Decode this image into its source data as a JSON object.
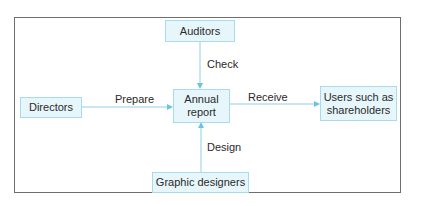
{
  "diagram": {
    "type": "flow",
    "nodes": {
      "auditors": "Auditors",
      "annual_report_line1": "Annual",
      "annual_report_line2": "report",
      "directors": "Directors",
      "users_line1": "Users such as",
      "users_line2": "shareholders",
      "graphic_designers": "Graphic designers"
    },
    "edges": {
      "check": "Check",
      "prepare": "Prepare",
      "receive": "Receive",
      "design": "Design"
    },
    "relations": [
      {
        "from": "Auditors",
        "to": "Annual report",
        "label": "Check"
      },
      {
        "from": "Directors",
        "to": "Annual report",
        "label": "Prepare"
      },
      {
        "from": "Annual report",
        "to": "Users such as shareholders",
        "label": "Receive"
      },
      {
        "from": "Graphic designers",
        "to": "Annual report",
        "label": "Design"
      }
    ],
    "colors": {
      "node_fill": "#e6f6fb",
      "node_border": "#a7dcec",
      "arrow": "#6cc4e0",
      "frame": "#6e6e6e"
    }
  }
}
